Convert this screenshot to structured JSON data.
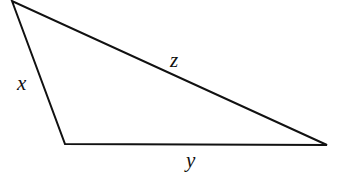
{
  "diagram": {
    "type": "triangle",
    "stroke_color": "#111111",
    "vertices": [
      [
        12,
        1
      ],
      [
        65,
        144
      ],
      [
        327,
        145
      ]
    ],
    "sides": [
      {
        "label": "x",
        "from": 0,
        "to": 1
      },
      {
        "label": "y",
        "from": 1,
        "to": 2
      },
      {
        "label": "z",
        "from": 0,
        "to": 2
      }
    ]
  }
}
